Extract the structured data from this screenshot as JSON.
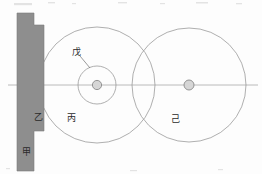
{
  "figure": {
    "kind": "mechanical-line-drawing",
    "width": 262,
    "height": 174,
    "background_color": "#fdfdfd"
  },
  "colors": {
    "bracket_fill": "#8e8e8e",
    "bracket_stroke": "#7d7d7d",
    "circle_stroke": "#9a9a9a",
    "axis_stroke": "#a8a8a8",
    "hub_fill": "#d6d6d6",
    "hub_stroke": "#8a8a8a",
    "label_color": "#2a2a2a",
    "leader_color": "#6e6e6e"
  },
  "labels": {
    "jia": {
      "text": "甲",
      "x": 26,
      "y": 152
    },
    "yi": {
      "text": "乙",
      "x": 38,
      "y": 117
    },
    "bing": {
      "text": "丙",
      "x": 71,
      "y": 118
    },
    "wu": {
      "text": "戊",
      "x": 76,
      "y": 52
    },
    "ji": {
      "text": "己",
      "x": 175,
      "y": 119
    }
  },
  "bracket": {
    "name": "stepped-support-bracket",
    "points": "17,13 34,13 34,25 44,25 44,131 34,131 34,171 17,171"
  },
  "axis": {
    "name": "horizontal-centerline",
    "x1": 8,
    "y1": 85,
    "x2": 258,
    "y2": 85
  },
  "circles": [
    {
      "name": "large-left-circle-bing",
      "cx": 97,
      "cy": 85,
      "r": 58
    },
    {
      "name": "inner-circle-wu",
      "cx": 97,
      "cy": 85,
      "r": 19
    },
    {
      "name": "large-right-circle-ji",
      "cx": 189,
      "cy": 85,
      "r": 57
    }
  ],
  "hubs": [
    {
      "name": "left-hub-center",
      "cx": 97,
      "cy": 85,
      "r": 4.6
    },
    {
      "name": "right-hub-center",
      "cx": 189,
      "cy": 85,
      "r": 5.0
    }
  ],
  "leader_line": {
    "name": "leader-line-wu",
    "x1": 80,
    "y1": 56,
    "x2": 90,
    "y2": 68
  }
}
